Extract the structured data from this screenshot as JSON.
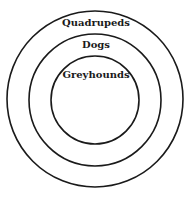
{
  "diagram": {
    "type": "nested-sets",
    "sets": [
      {
        "label": "Quadrupeds",
        "level": "outer"
      },
      {
        "label": "Dogs",
        "level": "middle"
      },
      {
        "label": "Greyhounds",
        "level": "inner"
      }
    ],
    "colors": {
      "stroke": "#1a1a1a",
      "background": "#ffffff"
    }
  }
}
